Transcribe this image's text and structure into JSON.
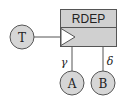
{
  "diagram": {
    "block": {
      "title": "RDEP",
      "fill": "#d0d0d0",
      "stroke": "#555555"
    },
    "nodes": [
      {
        "id": "T",
        "label": "T"
      },
      {
        "id": "A",
        "label": "A"
      },
      {
        "id": "B",
        "label": "B"
      }
    ],
    "edges": [
      {
        "from": "T",
        "to": "RDEP",
        "port": "clock-input",
        "label": ""
      },
      {
        "from": "RDEP",
        "to": "A",
        "label": "γ"
      },
      {
        "from": "RDEP",
        "to": "B",
        "label": "δ"
      }
    ],
    "node_fill": "#d6d6d6",
    "node_stroke": "#555555"
  }
}
